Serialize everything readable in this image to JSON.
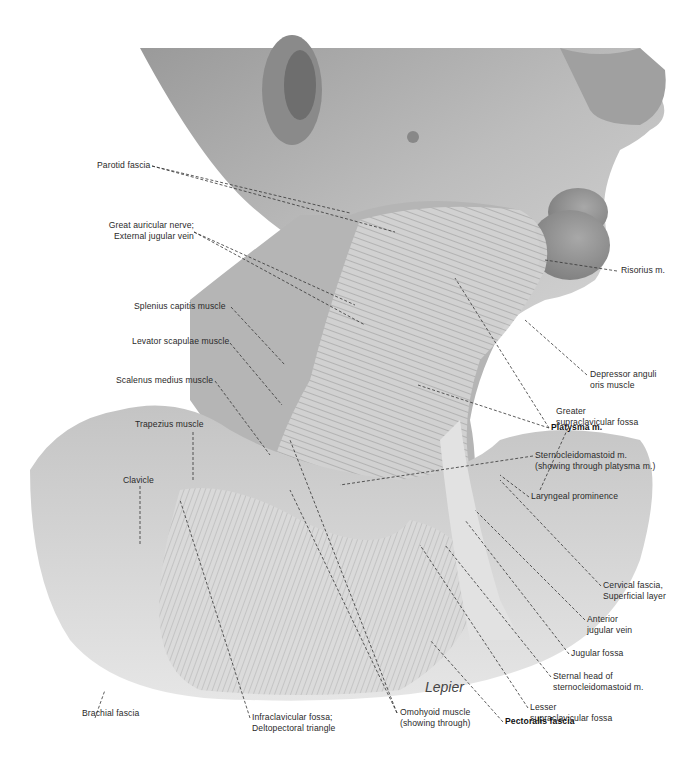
{
  "figure": {
    "signature": "Lepier"
  },
  "labels": {
    "parotid_fascia": {
      "lines": [
        "Parotid fascia"
      ]
    },
    "great_auricular": {
      "lines": [
        "Great auricular nerve;",
        "External jugular vein"
      ]
    },
    "risorius": {
      "lines": [
        "Risorius m."
      ]
    },
    "splenius_capitis": {
      "lines": [
        "Splenius capitis muscle"
      ]
    },
    "levator_scapulae": {
      "lines": [
        "Levator scapulae muscle"
      ]
    },
    "scalenus_medius": {
      "lines": [
        "Scalenus medius muscle"
      ]
    },
    "trapezius": {
      "lines": [
        "Trapezius muscle"
      ]
    },
    "clavicle": {
      "lines": [
        "Clavicle"
      ]
    },
    "depressor_anguli_oris": {
      "lines": [
        "Depressor anguli",
        "oris muscle"
      ]
    },
    "platysma": {
      "lines": [
        "Platysma m."
      ]
    },
    "sternocleidomastoid": {
      "lines": [
        "Sternocleidomastoid m.",
        "(showing through platysma m.)"
      ]
    },
    "laryngeal_prominence": {
      "lines": [
        "Laryngeal prominence"
      ]
    },
    "greater_supraclavicular": {
      "lines": [
        "Greater",
        "supraclavicular fossa"
      ]
    },
    "cervical_fascia": {
      "lines": [
        "Cervical fascia,",
        "Superficial layer"
      ]
    },
    "anterior_jugular": {
      "lines": [
        "Anterior",
        "jugular vein"
      ]
    },
    "jugular_fossa": {
      "lines": [
        "Jugular fossa"
      ]
    },
    "sternal_head": {
      "lines": [
        "Sternal head of",
        "sternocleidomastoid m."
      ]
    },
    "lesser_supraclavicular": {
      "lines": [
        "Lesser",
        "supraclavicular fossa"
      ]
    },
    "brachial_fascia": {
      "lines": [
        "Brachial fascia"
      ]
    },
    "infraclavicular": {
      "lines": [
        "Infraclavicular fossa;",
        "Deltopectoral triangle"
      ]
    },
    "omohyoid": {
      "lines": [
        "Omohyoid muscle",
        "(showing through)"
      ]
    },
    "pectoralis_fascia": {
      "lines": [
        "Pectoralis fascia"
      ]
    }
  }
}
